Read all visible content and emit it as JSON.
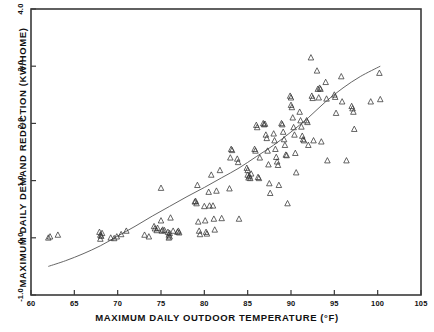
{
  "chart_data": {
    "type": "scatter",
    "title": "",
    "xlabel": "MAXIMUM DAILY OUTDOOR TEMPERATURE  (°F)",
    "ylabel": "MAXIMUM DAILY DEMAND REDUCTION  (KW/HOME)",
    "xlim": [
      60,
      105
    ],
    "ylim": [
      -1.0,
      4.0
    ],
    "xticks": [
      60,
      65,
      70,
      75,
      80,
      85,
      90,
      95,
      100,
      105
    ],
    "xtick_labels": [
      "60",
      "65",
      "70",
      "75",
      "80",
      "85",
      "90",
      "95",
      "100",
      "105"
    ],
    "yticks": [
      -1.0,
      0.0,
      1.0,
      2.0,
      3.0,
      4.0
    ],
    "ytick_labels": [
      "-1.0",
      "0.0",
      "1.0",
      "2.0",
      "3.0",
      "4.0"
    ],
    "grid": false,
    "legend": null,
    "marker": "open-triangle",
    "marker_color": "#333333",
    "curve_color": "#555555",
    "frame_color": "#3a3a3a",
    "series": [
      {
        "name": "observations",
        "marker": "triangle-up-open",
        "points": [
          [
            62.0,
            0.0
          ],
          [
            62.2,
            0.02
          ],
          [
            63.1,
            0.05
          ],
          [
            67.9,
            0.1
          ],
          [
            68.0,
            0.05
          ],
          [
            68.0,
            -0.02
          ],
          [
            68.1,
            0.03
          ],
          [
            68.2,
            0.08
          ],
          [
            69.2,
            0.0
          ],
          [
            69.6,
            -0.01
          ],
          [
            69.9,
            0.02
          ],
          [
            70.4,
            0.06
          ],
          [
            71.0,
            0.12
          ],
          [
            73.1,
            0.05
          ],
          [
            73.6,
            0.02
          ],
          [
            74.2,
            0.2
          ],
          [
            74.3,
            0.16
          ],
          [
            74.5,
            0.13
          ],
          [
            74.6,
            0.17
          ],
          [
            75.0,
            0.87
          ],
          [
            75.0,
            0.3
          ],
          [
            75.1,
            0.12
          ],
          [
            75.2,
            0.14
          ],
          [
            75.4,
            0.13
          ],
          [
            75.8,
            0.1
          ],
          [
            75.9,
            0.05
          ],
          [
            75.9,
            0.0
          ],
          [
            76.0,
            0.02
          ],
          [
            76.0,
            0.08
          ],
          [
            76.1,
            0.35
          ],
          [
            76.4,
            0.12
          ],
          [
            76.9,
            0.1
          ],
          [
            77.0,
            0.12
          ],
          [
            77.1,
            0.09
          ],
          [
            78.9,
            0.63
          ],
          [
            79.0,
            0.64
          ],
          [
            79.1,
            0.6
          ],
          [
            79.2,
            0.92
          ],
          [
            79.3,
            0.28
          ],
          [
            79.4,
            0.12
          ],
          [
            79.5,
            0.06
          ],
          [
            80.0,
            0.55
          ],
          [
            80.1,
            0.3
          ],
          [
            80.2,
            0.1
          ],
          [
            80.3,
            0.07
          ],
          [
            80.5,
            0.8
          ],
          [
            80.6,
            0.56
          ],
          [
            80.8,
            1.1
          ],
          [
            81.0,
            0.56
          ],
          [
            81.1,
            0.33
          ],
          [
            81.2,
            0.14
          ],
          [
            81.4,
            0.82
          ],
          [
            81.8,
            1.18
          ],
          [
            82.0,
            0.34
          ],
          [
            82.9,
            0.86
          ],
          [
            83.0,
            1.4
          ],
          [
            83.1,
            1.55
          ],
          [
            83.2,
            1.53
          ],
          [
            83.8,
            1.38
          ],
          [
            83.9,
            1.32
          ],
          [
            84.0,
            0.33
          ],
          [
            84.9,
            1.22
          ],
          [
            85.0,
            1.18
          ],
          [
            85.0,
            1.1
          ],
          [
            85.1,
            1.05
          ],
          [
            85.2,
            1.08
          ],
          [
            85.3,
            1.04
          ],
          [
            85.4,
            1.12
          ],
          [
            85.8,
            1.55
          ],
          [
            85.9,
            1.52
          ],
          [
            86.0,
            1.97
          ],
          [
            86.1,
            1.93
          ],
          [
            86.2,
            1.06
          ],
          [
            86.3,
            1.04
          ],
          [
            86.4,
            1.4
          ],
          [
            86.8,
            2.0
          ],
          [
            86.9,
            1.98
          ],
          [
            87.0,
            1.99
          ],
          [
            87.1,
            1.8
          ],
          [
            87.2,
            1.74
          ],
          [
            87.3,
            1.52
          ],
          [
            87.4,
            1.28
          ],
          [
            87.5,
            0.95
          ],
          [
            87.6,
            0.78
          ],
          [
            88.0,
            1.82
          ],
          [
            88.1,
            1.7
          ],
          [
            88.2,
            1.55
          ],
          [
            88.3,
            1.41
          ],
          [
            88.4,
            1.33
          ],
          [
            88.5,
            1.27
          ],
          [
            88.6,
            0.92
          ],
          [
            88.9,
            2.0
          ],
          [
            89.0,
            1.98
          ],
          [
            89.1,
            1.85
          ],
          [
            89.2,
            1.72
          ],
          [
            89.3,
            1.62
          ],
          [
            89.4,
            1.45
          ],
          [
            89.5,
            1.44
          ],
          [
            89.6,
            0.6
          ],
          [
            89.9,
            2.48
          ],
          [
            90.0,
            2.45
          ],
          [
            90.0,
            2.32
          ],
          [
            90.1,
            2.28
          ],
          [
            90.2,
            2.1
          ],
          [
            90.3,
            1.93
          ],
          [
            90.4,
            1.8
          ],
          [
            90.5,
            1.48
          ],
          [
            90.6,
            1.14
          ],
          [
            91.0,
            2.2
          ],
          [
            91.1,
            2.05
          ],
          [
            91.2,
            1.94
          ],
          [
            91.3,
            1.78
          ],
          [
            91.4,
            1.72
          ],
          [
            91.5,
            1.7
          ],
          [
            91.8,
            2.05
          ],
          [
            91.9,
            2.02
          ],
          [
            92.0,
            1.62
          ],
          [
            92.3,
            3.15
          ],
          [
            92.4,
            2.48
          ],
          [
            92.5,
            2.44
          ],
          [
            92.6,
            1.7
          ],
          [
            93.0,
            2.92
          ],
          [
            93.1,
            2.6
          ],
          [
            93.2,
            2.45
          ],
          [
            93.3,
            2.62
          ],
          [
            93.4,
            2.6
          ],
          [
            93.5,
            1.68
          ],
          [
            94.0,
            2.72
          ],
          [
            94.1,
            2.43
          ],
          [
            94.2,
            1.35
          ],
          [
            95.0,
            2.5
          ],
          [
            95.1,
            2.46
          ],
          [
            95.2,
            2.18
          ],
          [
            95.8,
            2.82
          ],
          [
            95.9,
            2.38
          ],
          [
            96.4,
            1.35
          ],
          [
            97.0,
            2.3
          ],
          [
            97.1,
            2.26
          ],
          [
            97.2,
            2.2
          ],
          [
            97.3,
            1.9
          ],
          [
            99.2,
            2.38
          ],
          [
            100.2,
            2.88
          ],
          [
            100.3,
            2.42
          ]
        ]
      }
    ],
    "fit_curve": {
      "name": "fitted-regression-curve",
      "description": "monotonic increasing fitted curve",
      "points": [
        [
          62.0,
          -0.5
        ],
        [
          64.0,
          -0.4
        ],
        [
          66.0,
          -0.28
        ],
        [
          68.0,
          -0.14
        ],
        [
          70.0,
          0.03
        ],
        [
          72.0,
          0.2
        ],
        [
          74.0,
          0.38
        ],
        [
          76.0,
          0.55
        ],
        [
          78.0,
          0.72
        ],
        [
          80.0,
          0.88
        ],
        [
          82.0,
          1.05
        ],
        [
          84.0,
          1.22
        ],
        [
          86.0,
          1.42
        ],
        [
          88.0,
          1.62
        ],
        [
          90.0,
          1.85
        ],
        [
          92.0,
          2.1
        ],
        [
          94.0,
          2.38
        ],
        [
          96.0,
          2.62
        ],
        [
          98.0,
          2.82
        ],
        [
          100.3,
          3.0
        ]
      ]
    }
  }
}
